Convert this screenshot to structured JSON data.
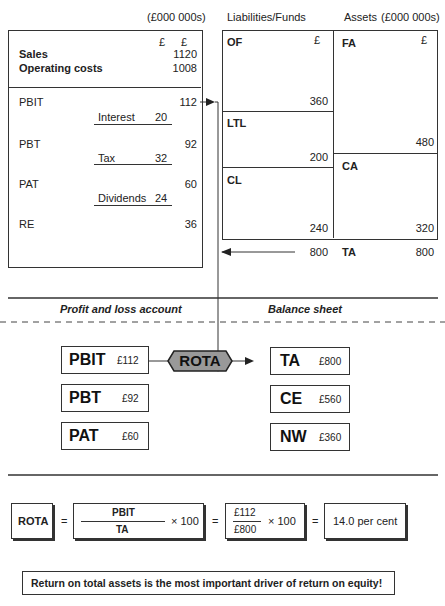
{
  "pl_statement": {
    "units": "(£000 000s)",
    "currency_headers": [
      "£",
      "£"
    ],
    "sales_label": "Sales",
    "sales_value": "1120",
    "opcosts_label": "Operating costs",
    "opcosts_value": "1008",
    "rows": [
      {
        "label": "PBIT",
        "value": "112",
        "deduction_label": "Interest",
        "deduction_value": "20"
      },
      {
        "label": "PBT",
        "value": "92",
        "deduction_label": "Tax",
        "deduction_value": "32"
      },
      {
        "label": "PAT",
        "value": "60",
        "deduction_label": "Dividends",
        "deduction_value": "24"
      },
      {
        "label": "RE",
        "value": "36"
      }
    ]
  },
  "balance_sheet": {
    "liabilities_header": "Liabilities/Funds",
    "assets_header": "Assets",
    "units": "(£000 000s)",
    "currency": "£",
    "liabilities": [
      {
        "label": "OF",
        "value": "360"
      },
      {
        "label": "LTL",
        "value": "200"
      },
      {
        "label": "CL",
        "value": "240"
      }
    ],
    "assets": [
      {
        "label": "FA",
        "value": "480"
      },
      {
        "label": "CA",
        "value": "320"
      }
    ],
    "liabilities_total": "800",
    "assets_total_label": "TA",
    "assets_total": "800"
  },
  "section_labels": {
    "left": "Profit and loss account",
    "right": "Balance sheet"
  },
  "ratio_diagram": {
    "center": "ROTA",
    "left": [
      {
        "label": "PBIT",
        "value": "£112"
      },
      {
        "label": "PBT",
        "value": "£92"
      },
      {
        "label": "PAT",
        "value": "£60"
      }
    ],
    "right": [
      {
        "label": "TA",
        "value": "£800"
      },
      {
        "label": "CE",
        "value": "£560"
      },
      {
        "label": "NW",
        "value": "£360"
      }
    ]
  },
  "formula": {
    "name": "ROTA",
    "eq": "=",
    "numerator": "PBIT",
    "denominator": "TA",
    "times": "× 100",
    "num_value": "£112",
    "den_value": "£800",
    "result": "14.0 per cent"
  },
  "conclusion": "Return on total assets is the most important driver of return on equity!"
}
